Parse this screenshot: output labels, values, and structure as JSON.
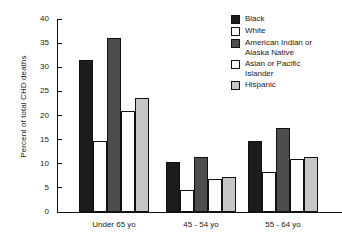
{
  "chart_data": {
    "type": "bar",
    "title": "",
    "subtitle": "",
    "xlabel": "",
    "ylabel": "Percent of total CHD deaths",
    "categories": [
      "Under 65 yo",
      "45 - 54 yo",
      "55 - 64 yo"
    ],
    "series": [
      {
        "name": "Black",
        "color": "#1c1c1c",
        "values": [
          31.6,
          10.4,
          14.8
        ]
      },
      {
        "name": "White",
        "color": "#ffffff",
        "values": [
          14.7,
          4.6,
          8.3
        ]
      },
      {
        "name": "American Indian or Alaska Native",
        "color": "#4d4d4d",
        "values": [
          36.1,
          11.3,
          17.4
        ]
      },
      {
        "name": "Asian or Pacific Islander",
        "color": "#ffffff",
        "values": [
          20.9,
          6.8,
          10.9
        ]
      },
      {
        "name": "Hispanic",
        "color": "#c6c6c6",
        "values": [
          23.6,
          7.3,
          11.5
        ]
      }
    ],
    "ylim": [
      0,
      40
    ],
    "yticks": [
      0,
      5,
      10,
      15,
      20,
      25,
      30,
      35,
      40
    ],
    "ytick_labels": [
      "0",
      "5",
      "10",
      "15",
      "20",
      "25",
      "30",
      "35",
      "40"
    ],
    "grid": false,
    "legend_position": "right",
    "legend_entries": [
      "Black",
      "White",
      "American Indian or Alaska Native",
      "Asian or Pacific Islander",
      "Hispanic"
    ]
  },
  "legend": {
    "items": [
      {
        "label_line1": "Black",
        "label_line2": ""
      },
      {
        "label_line1": "White",
        "label_line2": ""
      },
      {
        "label_line1": "American Indian or",
        "label_line2": "Alaska Native"
      },
      {
        "label_line1": "Asian or Pacific",
        "label_line2": "Islander"
      },
      {
        "label_line1": "Hispanic",
        "label_line2": ""
      }
    ]
  }
}
